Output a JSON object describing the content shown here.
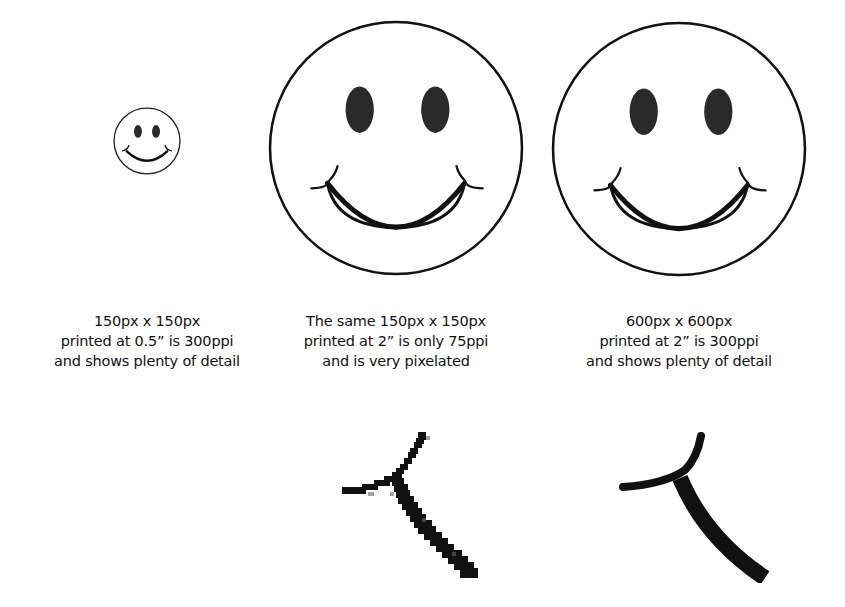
{
  "figures": [
    {
      "id": "small",
      "caption": [
        "150px x 150px",
        "printed at 0.5” is 300ppi",
        "and shows plenty of detail"
      ]
    },
    {
      "id": "pixelated",
      "caption": [
        "The same 150px x 150px",
        "printed at 2” is only 75ppi",
        "and is very pixelated"
      ]
    },
    {
      "id": "highres",
      "caption": [
        "600px x 600px",
        "printed at 2” is 300ppi",
        "and shows plenty of detail"
      ]
    }
  ],
  "colors": {
    "ink": "#111111",
    "eye": "#2a2a2a",
    "background": "#ffffff"
  }
}
